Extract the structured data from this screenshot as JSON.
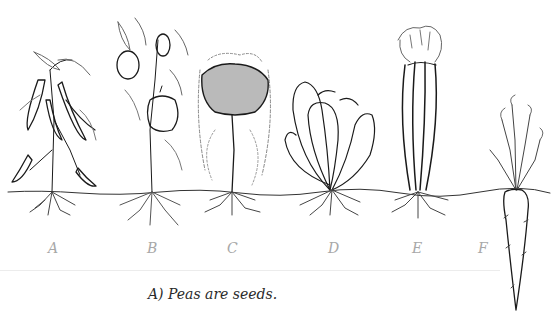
{
  "diagram": {
    "plants": [
      {
        "label": "A",
        "name": "pea plant"
      },
      {
        "label": "B",
        "name": "bell pepper plant"
      },
      {
        "label": "C",
        "name": "broccoli plant"
      },
      {
        "label": "D",
        "name": "lettuce plant"
      },
      {
        "label": "E",
        "name": "celery plant"
      },
      {
        "label": "F",
        "name": "carrot plant"
      }
    ]
  },
  "answer": {
    "text": "A) Peas are seeds."
  }
}
